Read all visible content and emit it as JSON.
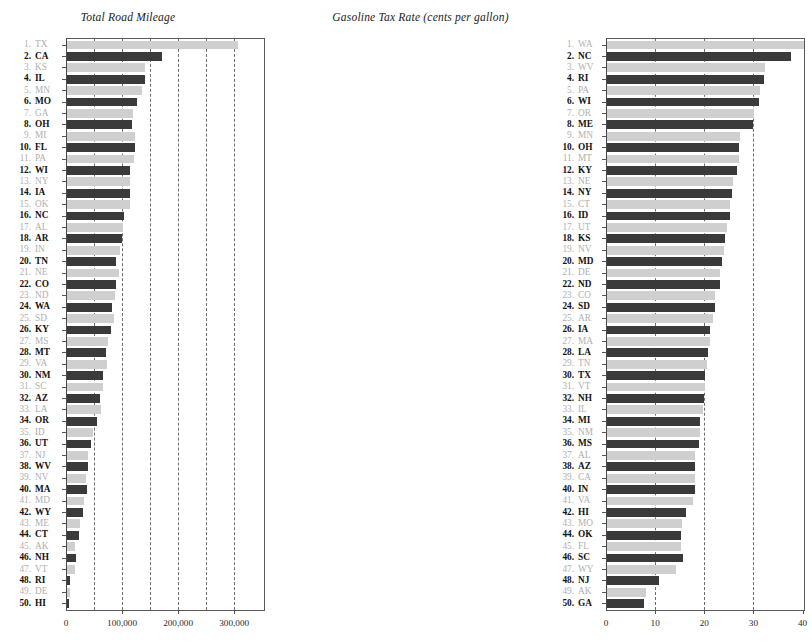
{
  "page": {
    "width": 545,
    "height": 642,
    "background": "#ffffff",
    "dark_color": "#3a3a3a",
    "light_color": "#cfcfcf",
    "dark_label_color": "#121212",
    "light_label_color": "#b0b0b0"
  },
  "panels": [
    {
      "id": "left",
      "title": "Total Road Mileage"
    },
    {
      "id": "right",
      "title": "Gasoline Tax Rate (cents per gallon)"
    }
  ],
  "chart_data": [
    {
      "type": "bar",
      "orientation": "horizontal",
      "title": "Total Road Mileage",
      "xlabel": "",
      "ylabel": "",
      "xlim": [
        0,
        355000
      ],
      "xticks": [
        0,
        100000,
        200000,
        300000
      ],
      "xtick_labels": [
        "0",
        "100,000",
        "200,000",
        "300,000"
      ],
      "minor_gridlines": [
        50000,
        100000,
        150000,
        200000,
        250000,
        300000
      ],
      "grid": true,
      "legend": "none",
      "sorted": "descending",
      "categories": [
        "TX",
        "CA",
        "KS",
        "IL",
        "MN",
        "MO",
        "GA",
        "OH",
        "MI",
        "FL",
        "PA",
        "WI",
        "NY",
        "IA",
        "OK",
        "NC",
        "AL",
        "AR",
        "IN",
        "TN",
        "NE",
        "CO",
        "ND",
        "WA",
        "SD",
        "KY",
        "MS",
        "MT",
        "VA",
        "NM",
        "SC",
        "AZ",
        "LA",
        "OR",
        "ID",
        "UT",
        "NJ",
        "WV",
        "NV",
        "MA",
        "MD",
        "WY",
        "ME",
        "CT",
        "AK",
        "NH",
        "VT",
        "RI",
        "DE",
        "HI"
      ],
      "ranks": [
        1,
        2,
        3,
        4,
        5,
        6,
        7,
        8,
        9,
        10,
        11,
        12,
        13,
        14,
        15,
        16,
        17,
        18,
        19,
        20,
        21,
        22,
        23,
        24,
        25,
        26,
        27,
        28,
        29,
        30,
        31,
        32,
        33,
        34,
        35,
        36,
        37,
        38,
        39,
        40,
        41,
        42,
        43,
        44,
        45,
        46,
        47,
        48,
        49,
        50
      ],
      "values": [
        305000,
        170000,
        140000,
        139000,
        133000,
        125000,
        117000,
        116000,
        121000,
        121000,
        120000,
        112000,
        113000,
        113000,
        112000,
        102000,
        100000,
        99000,
        94000,
        87000,
        93000,
        87000,
        86000,
        80000,
        83000,
        79000,
        74000,
        70000,
        71000,
        64000,
        65000,
        59000,
        60000,
        53000,
        47000,
        43000,
        38000,
        37000,
        34000,
        35000,
        30000,
        28000,
        23000,
        21000,
        14000,
        16000,
        14000,
        6000,
        6000,
        4000
      ],
      "bar_styles": [
        "light",
        "dark",
        "light",
        "dark",
        "light",
        "dark",
        "light",
        "dark",
        "light",
        "dark",
        "light",
        "dark",
        "light",
        "dark",
        "light",
        "dark",
        "light",
        "dark",
        "light",
        "dark",
        "light",
        "dark",
        "light",
        "dark",
        "light",
        "dark",
        "light",
        "dark",
        "light",
        "dark",
        "light",
        "dark",
        "light",
        "dark",
        "light",
        "dark",
        "light",
        "dark",
        "light",
        "dark",
        "light",
        "dark",
        "light",
        "dark",
        "light",
        "dark",
        "light",
        "dark",
        "light",
        "dark"
      ]
    },
    {
      "type": "bar",
      "orientation": "horizontal",
      "title": "Gasoline Tax Rate (cents per gallon)",
      "xlabel": "",
      "ylabel": "",
      "xlim": [
        0,
        40.5
      ],
      "xticks": [
        0,
        10,
        20,
        30,
        40
      ],
      "xtick_labels": [
        "0",
        "10",
        "20",
        "30",
        "40"
      ],
      "minor_gridlines": [
        10,
        20,
        30
      ],
      "grid": true,
      "legend": "none",
      "sorted": "descending",
      "categories": [
        "WA",
        "NC",
        "WV",
        "RI",
        "PA",
        "WI",
        "OR",
        "ME",
        "MN",
        "OH",
        "MT",
        "KY",
        "NE",
        "NY",
        "CT",
        "ID",
        "UT",
        "KS",
        "NV",
        "MD",
        "DE",
        "ND",
        "CO",
        "SD",
        "AR",
        "IA",
        "MA",
        "LA",
        "TN",
        "TX",
        "VT",
        "NH",
        "IL",
        "MI",
        "NM",
        "MS",
        "AL",
        "AZ",
        "CA",
        "IN",
        "VA",
        "HI",
        "MO",
        "OK",
        "FL",
        "SC",
        "WY",
        "NJ",
        "AK",
        "GA"
      ],
      "ranks": [
        1,
        2,
        3,
        4,
        5,
        6,
        7,
        8,
        9,
        10,
        11,
        12,
        13,
        14,
        15,
        16,
        17,
        18,
        19,
        20,
        21,
        22,
        23,
        24,
        25,
        26,
        27,
        28,
        29,
        30,
        31,
        32,
        33,
        34,
        35,
        36,
        37,
        38,
        39,
        40,
        41,
        42,
        43,
        44,
        45,
        46,
        47,
        48,
        49,
        50
      ],
      "values": [
        40.0,
        37.5,
        32.2,
        32.0,
        31.2,
        30.9,
        30.0,
        29.8,
        27.1,
        26.9,
        26.8,
        26.4,
        25.6,
        25.4,
        25.0,
        25.0,
        24.5,
        24.0,
        23.8,
        23.5,
        23.0,
        23.0,
        22.0,
        22.0,
        21.5,
        21.0,
        21.0,
        20.5,
        20.4,
        20.0,
        20.0,
        19.8,
        19.5,
        19.0,
        18.9,
        18.8,
        18.0,
        18.0,
        18.0,
        18.0,
        17.5,
        16.0,
        15.3,
        15.0,
        15.0,
        15.5,
        14.0,
        10.5,
        8.0,
        7.5
      ],
      "bar_styles": [
        "light",
        "dark",
        "light",
        "dark",
        "light",
        "dark",
        "light",
        "dark",
        "light",
        "dark",
        "light",
        "dark",
        "light",
        "dark",
        "light",
        "dark",
        "light",
        "dark",
        "light",
        "dark",
        "light",
        "dark",
        "light",
        "dark",
        "light",
        "dark",
        "light",
        "dark",
        "light",
        "dark",
        "light",
        "dark",
        "light",
        "dark",
        "light",
        "dark",
        "light",
        "dark",
        "light",
        "dark",
        "light",
        "dark",
        "light",
        "dark",
        "light",
        "dark",
        "light",
        "dark",
        "light",
        "dark"
      ]
    }
  ]
}
